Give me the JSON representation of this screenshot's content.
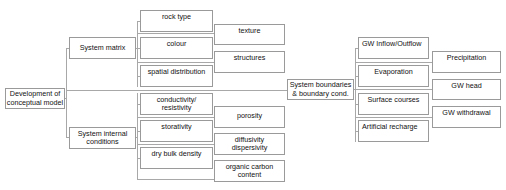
{
  "diagram": {
    "root": {
      "label": "Development of conceptual model",
      "lines": [
        "Development of",
        "conceptual model"
      ]
    },
    "branches": [
      {
        "label": "System matrix",
        "lines": [
          "System matrix"
        ],
        "children": [
          {
            "lines": [
              "rock type"
            ]
          },
          {
            "lines": [
              "colour"
            ]
          },
          {
            "lines": [
              "spatial distribution"
            ]
          }
        ],
        "leaves": [
          {
            "lines": [
              "texture"
            ]
          },
          {
            "lines": [
              "structures"
            ]
          }
        ]
      },
      {
        "label": "System internal conditions",
        "lines": [
          "System internal",
          "conditions"
        ],
        "children": [
          {
            "lines": [
              "conductivity/",
              "resistivity"
            ]
          },
          {
            "lines": [
              "storativity"
            ]
          },
          {
            "lines": [
              "dry bulk density"
            ]
          }
        ],
        "leaves": [
          {
            "lines": [
              "porosity"
            ]
          },
          {
            "lines": [
              "diffusivity",
              "dispersivity"
            ]
          },
          {
            "lines": [
              "organic carbon",
              "content"
            ]
          }
        ]
      },
      {
        "label": "System boundaries & boundary cond.",
        "lines": [
          "System boundaries",
          "& boundary cond."
        ],
        "children": [
          {
            "lines": [
              "GW Inflow/Outflow"
            ]
          },
          {
            "lines": [
              "Evaporation"
            ]
          },
          {
            "lines": [
              "Surface courses"
            ]
          },
          {
            "lines": [
              "Artificial recharge"
            ]
          }
        ],
        "leaves": [
          {
            "lines": [
              "Precipitation"
            ]
          },
          {
            "lines": [
              "GW head"
            ]
          },
          {
            "lines": [
              "GW withdrawal"
            ]
          }
        ]
      }
    ]
  },
  "colors": {
    "border": "#9a9a9a",
    "connector": "#a8a8a8",
    "text": "#111111",
    "background": "#ffffff"
  }
}
